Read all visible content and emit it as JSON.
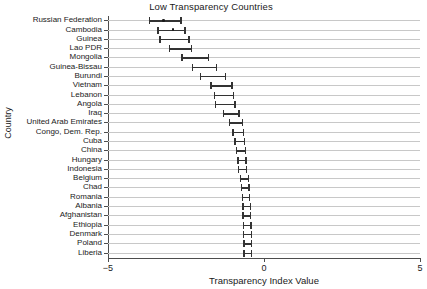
{
  "chart_data": {
    "type": "scatter",
    "title": "Low Transparency Countries",
    "xlabel": "Transparency Index Value",
    "ylabel": "Country",
    "xlim": [
      -5,
      5
    ],
    "xticks": [
      -5,
      0,
      5
    ],
    "xticklabels": [
      "−5",
      "0",
      "5"
    ],
    "grid": true,
    "legend": "none",
    "orientation": "horizontal-error-bars",
    "categories": [
      "Russian Federation",
      "Cambodia",
      "Guinea",
      "Lao PDR",
      "Mongolia",
      "Guinea-Bissau",
      "Burundi",
      "Vietnam",
      "Lebanon",
      "Angola",
      "Iraq",
      "United Arab Emirates",
      "Congo, Dem. Rep.",
      "Cuba",
      "China",
      "Hungary",
      "Indonesia",
      "Belgium",
      "Chad",
      "Romania",
      "Albania",
      "Afghanistan",
      "Ethiopia",
      "Denmark",
      "Poland",
      "Liberia"
    ],
    "values": [
      -3.22,
      -2.92,
      -2.82,
      -2.65,
      -2.15,
      -1.83,
      -1.58,
      -1.35,
      -1.28,
      -1.25,
      -1.05,
      -0.92,
      -0.85,
      -0.8,
      -0.75,
      -0.72,
      -0.7,
      -0.65,
      -0.62,
      -0.6,
      -0.58,
      -0.57,
      -0.56,
      -0.55,
      -0.55,
      -0.55
    ],
    "ci_low": [
      -3.7,
      -3.42,
      -3.36,
      -3.05,
      -2.65,
      -2.32,
      -2.05,
      -1.72,
      -1.6,
      -1.58,
      -1.32,
      -1.12,
      -1.02,
      -0.95,
      -0.9,
      -0.86,
      -0.83,
      -0.78,
      -0.75,
      -0.72,
      -0.7,
      -0.69,
      -0.68,
      -0.67,
      -0.66,
      -0.66
    ],
    "ci_high": [
      -2.68,
      -2.55,
      -2.42,
      -2.35,
      -1.8,
      -1.54,
      -1.25,
      -1.05,
      -1.0,
      -0.95,
      -0.82,
      -0.72,
      -0.68,
      -0.65,
      -0.62,
      -0.6,
      -0.58,
      -0.52,
      -0.5,
      -0.48,
      -0.46,
      -0.45,
      -0.44,
      -0.43,
      -0.43,
      -0.43
    ],
    "show_point_marker": [
      true,
      true,
      false,
      false,
      false,
      false,
      false,
      false,
      false,
      false,
      false,
      false,
      false,
      false,
      false,
      false,
      false,
      false,
      false,
      false,
      false,
      false,
      false,
      false,
      false,
      false
    ],
    "colors": {
      "marker": "#1a1a1a",
      "errorbar": "#333333",
      "gridline": "#c8c8c8",
      "axis": "#4d4d4d",
      "background": "#ffffff"
    }
  }
}
